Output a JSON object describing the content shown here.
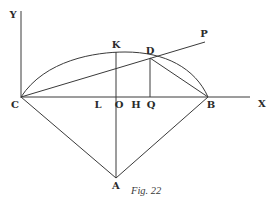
{
  "figure": {
    "caption": "Fig. 22",
    "labels": {
      "Y": "Y",
      "X": "X",
      "K": "K",
      "D": "D",
      "P": "P",
      "C": "C",
      "L": "L",
      "O": "O",
      "H": "H",
      "Q": "Q",
      "B": "B",
      "A": "A"
    },
    "line_color": "#3a3a3a"
  }
}
